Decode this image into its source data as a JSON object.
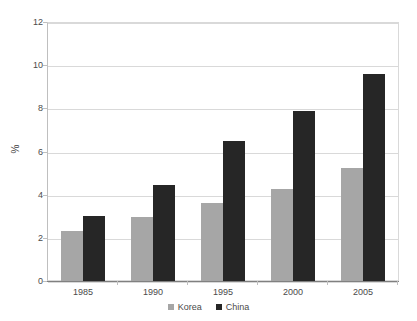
{
  "chart_data": {
    "type": "bar",
    "title": "",
    "subtitle": "",
    "xlabel": "",
    "ylabel": "%",
    "categories": [
      "1985",
      "1990",
      "1995",
      "2000",
      "2005"
    ],
    "series": [
      {
        "name": "Korea",
        "color": "#a6a6a6",
        "values": [
          2.3,
          2.95,
          3.6,
          4.25,
          5.25
        ]
      },
      {
        "name": "China",
        "color": "#262626",
        "values": [
          3.0,
          4.45,
          6.5,
          7.9,
          9.6
        ]
      }
    ],
    "ylim": [
      0,
      12
    ],
    "ytick_values": [
      0,
      2,
      4,
      6,
      8,
      10,
      12
    ],
    "ytick_labels": [
      "0",
      "2",
      "4",
      "6",
      "8",
      "10",
      "12"
    ],
    "grid": true,
    "grid_axis": "y",
    "legend_position": "bottom",
    "bar_mode": "grouped"
  },
  "axes": {
    "y_title": "%"
  },
  "legend": {
    "items": [
      {
        "label": "Korea",
        "color": "#a6a6a6"
      },
      {
        "label": "China",
        "color": "#262626"
      }
    ]
  },
  "colors": {
    "background": "#ffffff",
    "gridline": "#d9d9d9",
    "axis": "#808080",
    "text": "#4a4a4a",
    "korea": "#a6a6a6",
    "china": "#262626"
  }
}
